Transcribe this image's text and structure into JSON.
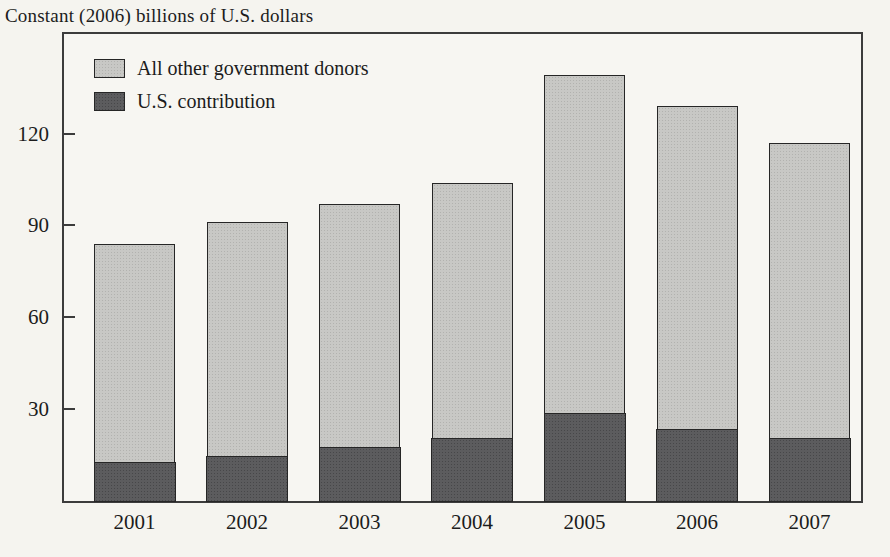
{
  "chart_title": "Constant (2006) billions of U.S. dollars",
  "chart_data": {
    "type": "bar",
    "stacked": true,
    "title": "",
    "ylabel": "Constant (2006) billions of U.S. dollars",
    "xlabel": "",
    "categories": [
      "2001",
      "2002",
      "2003",
      "2004",
      "2005",
      "2006",
      "2007"
    ],
    "series": [
      {
        "name": "U.S. contribution",
        "values": [
          13,
          15,
          18,
          21,
          29,
          24,
          21
        ],
        "color": "#5c5c5e",
        "texture_dot_color": "#474749"
      },
      {
        "name": "All other government donors",
        "values": [
          71,
          76,
          79,
          83,
          110,
          105,
          96
        ],
        "color": "#c8c8c5",
        "texture_dot_color": "#b2b2af"
      }
    ],
    "stack_totals": [
      84,
      91,
      97,
      104,
      139,
      129,
      117
    ],
    "yticks": [
      30,
      60,
      90,
      120
    ],
    "ylim": [
      0,
      152.5
    ],
    "grid": false,
    "legend_position": "top-left-inside",
    "legend_order": [
      "All other government donors",
      "U.S. contribution"
    ]
  },
  "colors": {
    "page_background": "#f5f4ef",
    "plot_background": "#f7f6f2",
    "axis": "#3c3c3c",
    "bar_border": "#262626",
    "text": "#1c1c1c"
  }
}
